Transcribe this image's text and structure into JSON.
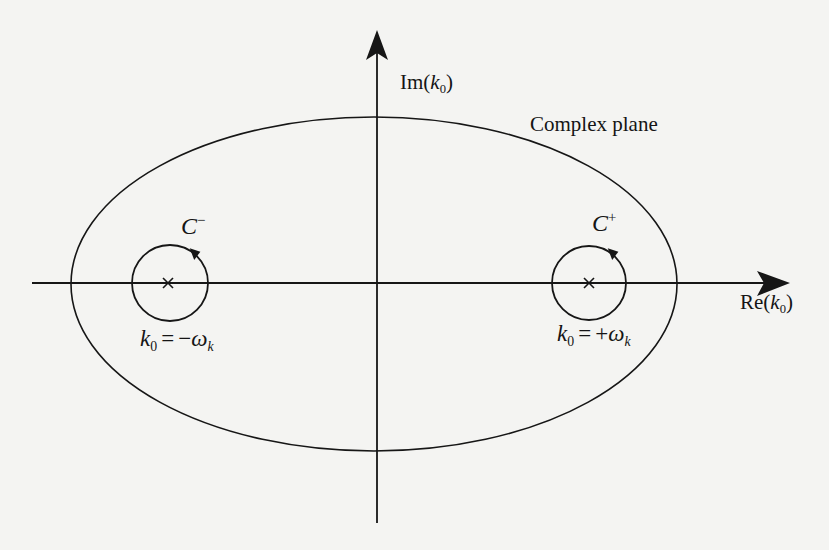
{
  "diagram": {
    "title": "Complex plane",
    "axes": {
      "horizontal": {
        "label_prefix": "Re(",
        "var": "k",
        "sub": "0",
        "label_suffix": ")"
      },
      "vertical": {
        "label_prefix": "Im(",
        "var": "k",
        "sub": "0",
        "label_suffix": ")"
      }
    },
    "contours": [
      {
        "id": "C-minus",
        "name": "C",
        "sup": "−",
        "orientation": "counterclockwise",
        "pole": {
          "marker": "×",
          "lhs_var": "k",
          "lhs_sub": "0",
          "eq": "=",
          "sign": "−",
          "rhs_var": "ω",
          "rhs_sub": "k"
        }
      },
      {
        "id": "C-plus",
        "name": "C",
        "sup": "+",
        "orientation": "counterclockwise",
        "pole": {
          "marker": "×",
          "lhs_var": "k",
          "lhs_sub": "0",
          "eq": "=",
          "sign": "+",
          "rhs_var": "ω",
          "rhs_sub": "k"
        }
      }
    ],
    "outer_contour": "ellipse",
    "colors": {
      "stroke": "#161616",
      "background": "#f4f4f2"
    }
  }
}
